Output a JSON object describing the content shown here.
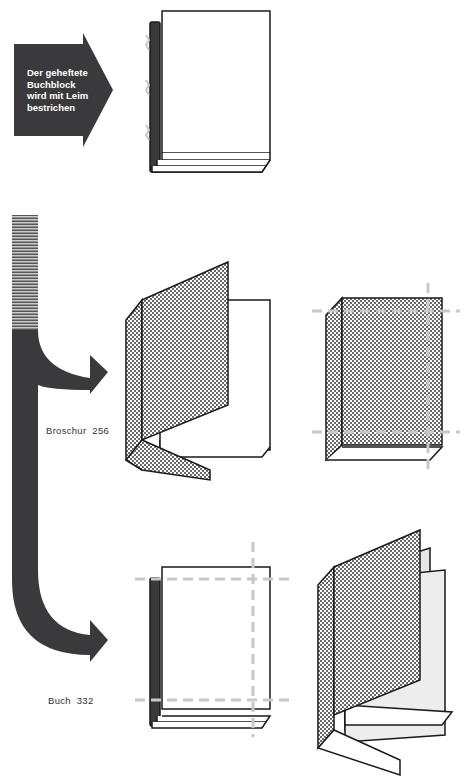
{
  "diagram": {
    "step_arrow": {
      "text": "Der geheftete Buchblock wird mit Leim bestrichen",
      "lines": [
        "Der geheftete",
        "Buchblock",
        "wird mit Leim",
        "bestrichen"
      ]
    },
    "branches": [
      {
        "label": "Broschur",
        "page_ref": "256",
        "caption": "Broschur  256"
      },
      {
        "label": "Buch",
        "page_ref": "332",
        "caption": "Buch  332"
      }
    ],
    "colors": {
      "arrow": "#3a3a3c",
      "outline": "#1a1a1a",
      "cut_line": "#c8c8c8",
      "dot_pattern": "#222222",
      "endpaper_gray": "#e6e6e6"
    }
  }
}
